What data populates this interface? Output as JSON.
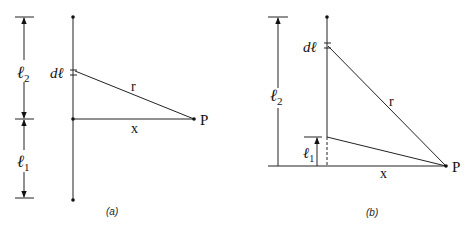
{
  "panels": {
    "a": {
      "caption": "(a)",
      "labels": {
        "l2": "ℓ",
        "l2_sub": "2",
        "l1": "ℓ",
        "l1_sub": "1",
        "dl": "dℓ",
        "r": "r",
        "x": "x",
        "P": "P"
      }
    },
    "b": {
      "caption": "(b)",
      "labels": {
        "l2": "ℓ",
        "l2_sub": "2",
        "l1": "ℓ",
        "l1_sub": "1",
        "dl": "dℓ",
        "r": "r",
        "x": "x",
        "P": "P"
      }
    }
  },
  "colors": {
    "line": "#222222",
    "background": "#ffffff"
  }
}
